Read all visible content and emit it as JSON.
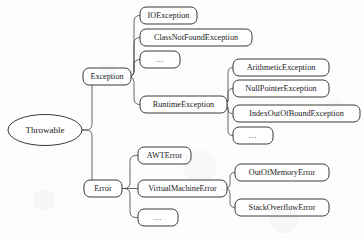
{
  "diagram": {
    "type": "tree",
    "background_color": "#fdfdfc",
    "node_stroke_color": "#3a3a3a",
    "connector_color": "#555555",
    "text_color": "#1a1a1a",
    "root": {
      "id": "throwable",
      "label": "Throwable",
      "shape": "ellipse",
      "cx": 45,
      "cy": 130,
      "rx": 37,
      "ry": 15.5,
      "font_size": 9
    },
    "nodes": [
      {
        "id": "exception",
        "label": "Exception",
        "shape": "rounded-rect",
        "x": 83,
        "y": 68,
        "w": 48,
        "h": 17,
        "font_size": 8.2,
        "parent": "throwable",
        "level": 1
      },
      {
        "id": "error",
        "label": "Error",
        "shape": "rounded-rect",
        "x": 84,
        "y": 180,
        "w": 38,
        "h": 17,
        "font_size": 8.2,
        "parent": "throwable",
        "level": 1
      },
      {
        "id": "ioexception",
        "label": "IOException",
        "shape": "rounded-rect",
        "x": 140,
        "y": 7,
        "w": 57,
        "h": 17,
        "font_size": 8.2,
        "parent": "exception",
        "level": 2
      },
      {
        "id": "classnotfoundexception",
        "label": "ClassNotFoundException",
        "shape": "rounded-rect",
        "x": 140,
        "y": 29,
        "w": 112,
        "h": 17,
        "font_size": 8.2,
        "parent": "exception",
        "level": 2
      },
      {
        "id": "exception-more",
        "label": "...",
        "shape": "rounded-rect",
        "x": 140,
        "y": 51,
        "w": 40,
        "h": 17,
        "font_size": 8.2,
        "parent": "exception",
        "level": 2
      },
      {
        "id": "runtimeexception",
        "label": "RuntimeException",
        "shape": "rounded-rect",
        "x": 140,
        "y": 96,
        "w": 87,
        "h": 17,
        "font_size": 8.2,
        "parent": "exception",
        "level": 2
      },
      {
        "id": "arithmeticexception",
        "label": "ArithmeticException",
        "shape": "rounded-rect",
        "x": 233,
        "y": 59,
        "w": 96,
        "h": 17,
        "font_size": 8.2,
        "parent": "runtimeexception",
        "level": 3
      },
      {
        "id": "nullpointerexception",
        "label": "NullPointerException",
        "shape": "rounded-rect",
        "x": 233,
        "y": 80,
        "w": 96,
        "h": 17,
        "font_size": 8.2,
        "parent": "runtimeexception",
        "level": 3
      },
      {
        "id": "indexoutofboundexception",
        "label": "IndexOutOfBoundException",
        "shape": "rounded-rect",
        "x": 233,
        "y": 105,
        "w": 127,
        "h": 17,
        "font_size": 8.2,
        "parent": "runtimeexception",
        "level": 3
      },
      {
        "id": "runtimeexception-more",
        "label": "...",
        "shape": "rounded-rect",
        "x": 233,
        "y": 127,
        "w": 40,
        "h": 17,
        "font_size": 8.2,
        "parent": "runtimeexception",
        "level": 3
      },
      {
        "id": "awterror",
        "label": "AWTError",
        "shape": "rounded-rect",
        "x": 138,
        "y": 147,
        "w": 53,
        "h": 17,
        "font_size": 8.2,
        "parent": "error",
        "level": 2
      },
      {
        "id": "virtualmachineerror",
        "label": "VirtualMachineError",
        "shape": "rounded-rect",
        "x": 138,
        "y": 180,
        "w": 89,
        "h": 17,
        "font_size": 8.2,
        "parent": "error",
        "level": 2
      },
      {
        "id": "error-more",
        "label": "...",
        "shape": "rounded-rect",
        "x": 138,
        "y": 209,
        "w": 40,
        "h": 17,
        "font_size": 8.2,
        "parent": "error",
        "level": 2
      },
      {
        "id": "outofmemoryerror",
        "label": "OutOfMemoryError",
        "shape": "rounded-rect",
        "x": 235,
        "y": 164,
        "w": 94,
        "h": 17,
        "font_size": 8.2,
        "parent": "virtualmachineerror",
        "level": 3
      },
      {
        "id": "stackoverflowerror",
        "label": "StackOverflowError",
        "shape": "rounded-rect",
        "x": 235,
        "y": 199,
        "w": 94,
        "h": 17,
        "font_size": 8.2,
        "parent": "virtualmachineerror",
        "level": 3
      }
    ],
    "edges": [
      {
        "id": "edge-throwable-exception",
        "from": "throwable",
        "to": "exception",
        "trunk_x": 92
      },
      {
        "id": "edge-throwable-error",
        "from": "throwable",
        "to": "error",
        "trunk_x": 92
      },
      {
        "id": "edge-exception-ioexception",
        "from": "exception",
        "to": "ioexception",
        "trunk_x": 134
      },
      {
        "id": "edge-exception-classnotfoundexception",
        "from": "exception",
        "to": "classnotfoundexception",
        "trunk_x": 134
      },
      {
        "id": "edge-exception-more",
        "from": "exception",
        "to": "exception-more",
        "trunk_x": 134
      },
      {
        "id": "edge-exception-runtimeexception",
        "from": "exception",
        "to": "runtimeexception",
        "trunk_x": 134
      },
      {
        "id": "edge-runtime-arithmeticexception",
        "from": "runtimeexception",
        "to": "arithmeticexception",
        "trunk_x": 228
      },
      {
        "id": "edge-runtime-nullpointerexception",
        "from": "runtimeexception",
        "to": "nullpointerexception",
        "trunk_x": 228
      },
      {
        "id": "edge-runtime-indexoutofboundexception",
        "from": "runtimeexception",
        "to": "indexoutofboundexception",
        "trunk_x": 228
      },
      {
        "id": "edge-runtime-more",
        "from": "runtimeexception",
        "to": "runtimeexception-more",
        "trunk_x": 228
      },
      {
        "id": "edge-error-awterror",
        "from": "error",
        "to": "awterror",
        "trunk_x": 130
      },
      {
        "id": "edge-error-virtualmachineerror",
        "from": "error",
        "to": "virtualmachineerror",
        "trunk_x": 130
      },
      {
        "id": "edge-error-more",
        "from": "error",
        "to": "error-more",
        "trunk_x": 130
      },
      {
        "id": "edge-vme-outofmemoryerror",
        "from": "virtualmachineerror",
        "to": "outofmemoryerror",
        "trunk_x": 230
      },
      {
        "id": "edge-vme-stackoverflowerror",
        "from": "virtualmachineerror",
        "to": "stackoverflowerror",
        "trunk_x": 230
      }
    ]
  }
}
